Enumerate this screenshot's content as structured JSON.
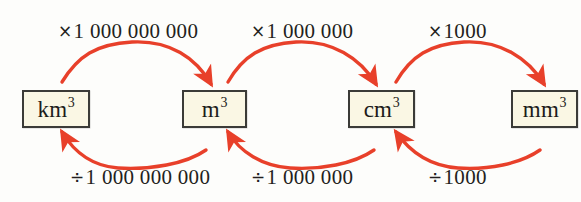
{
  "diagram": {
    "background_color": "#fdfdfb",
    "arrow_color": "#e8402a",
    "box_fill_color": "#faf7e4",
    "box_border_color": "#3b3b37",
    "text_color": "#231f20"
  },
  "units": [
    {
      "id": "km3",
      "base": "km",
      "exponent": "3",
      "label": "km3"
    },
    {
      "id": "m3",
      "base": "m",
      "exponent": "3",
      "label": "m3"
    },
    {
      "id": "cm3",
      "base": "cm",
      "exponent": "3",
      "label": "cm3"
    },
    {
      "id": "mm3",
      "base": "mm",
      "exponent": "3",
      "label": "mm3"
    }
  ],
  "multiply_labels": [
    {
      "symbol": "×",
      "value": "1 000 000 000",
      "from": "km3",
      "to": "m3"
    },
    {
      "symbol": "×",
      "value": "1 000 000",
      "from": "m3",
      "to": "cm3"
    },
    {
      "symbol": "×",
      "value": "1000",
      "from": "cm3",
      "to": "mm3"
    }
  ],
  "divide_labels": [
    {
      "symbol": "÷",
      "value": "1 000 000 000",
      "from": "m3",
      "to": "km3"
    },
    {
      "symbol": "÷",
      "value": "1 000 000",
      "from": "cm3",
      "to": "m3"
    },
    {
      "symbol": "÷",
      "value": "1000",
      "from": "mm3",
      "to": "cm3"
    }
  ]
}
